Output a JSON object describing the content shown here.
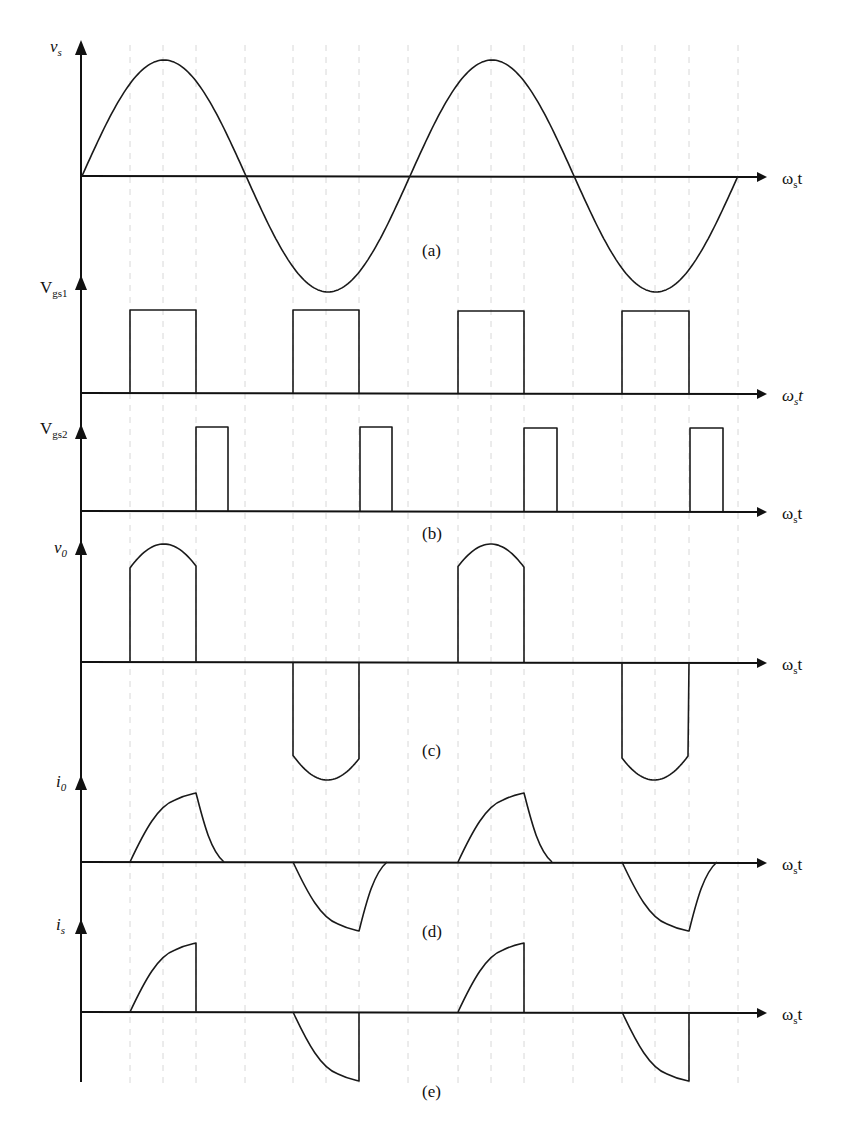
{
  "figure": {
    "x_axis_label": "ωst",
    "x_axis_label_parts": {
      "main": "ω",
      "sub": "s",
      "tail": "t"
    },
    "panels": [
      {
        "id": "a",
        "caption": "(a)",
        "y_label": {
          "main": "v",
          "sub": "s"
        }
      },
      {
        "id": "b1",
        "caption": "",
        "y_label": {
          "main": "V",
          "sub": "gs1"
        }
      },
      {
        "id": "b2",
        "caption": "(b)",
        "y_label": {
          "main": "V",
          "sub": "gs2"
        }
      },
      {
        "id": "c",
        "caption": "(c)",
        "y_label": {
          "main": "v",
          "sub": "0"
        }
      },
      {
        "id": "d",
        "caption": "(d)",
        "y_label": {
          "main": "i",
          "sub": "0"
        }
      },
      {
        "id": "e",
        "caption": "(e)",
        "y_label": {
          "main": "i",
          "sub": "s"
        }
      }
    ]
  },
  "chart_data": {
    "type": "line",
    "xlabel": "ωst",
    "grid": "dashed vertical lines",
    "grid_x_px": [
      130,
      163,
      196,
      245,
      293,
      326,
      359,
      408,
      458,
      491,
      524,
      573,
      622,
      655,
      689,
      738
    ],
    "series": [
      {
        "name": "vs",
        "panel": "a",
        "shape": "sinusoid",
        "periods": 2,
        "zero_crossings_px": [
          82,
          245,
          408,
          573,
          738
        ],
        "amplitude": 1
      },
      {
        "name": "Vgs1",
        "panel": "b",
        "shape": "pulse",
        "pulses_px": [
          [
            130,
            196
          ],
          [
            293,
            359
          ],
          [
            458,
            524
          ],
          [
            622,
            689
          ]
        ]
      },
      {
        "name": "Vgs2",
        "panel": "b",
        "shape": "pulse",
        "pulses_px": [
          [
            196,
            228
          ],
          [
            360,
            392
          ],
          [
            524,
            557
          ],
          [
            690,
            723
          ]
        ]
      },
      {
        "name": "v0",
        "panel": "c",
        "shape": "chopped-sine",
        "positive_px": [
          [
            130,
            196
          ],
          [
            458,
            524
          ]
        ],
        "negative_px": [
          [
            293,
            359
          ],
          [
            622,
            689
          ]
        ]
      },
      {
        "name": "i0",
        "panel": "d",
        "shape": "rise-then-decay",
        "positive_px": [
          [
            130,
            196,
            224
          ],
          [
            458,
            524,
            552
          ]
        ],
        "negative_px": [
          [
            293,
            359,
            387
          ],
          [
            622,
            689,
            717
          ]
        ]
      },
      {
        "name": "is",
        "panel": "e",
        "shape": "rise-then-cutoff",
        "positive_px": [
          [
            130,
            196
          ],
          [
            458,
            524
          ]
        ],
        "negative_px": [
          [
            293,
            359
          ],
          [
            622,
            689
          ]
        ]
      }
    ]
  }
}
